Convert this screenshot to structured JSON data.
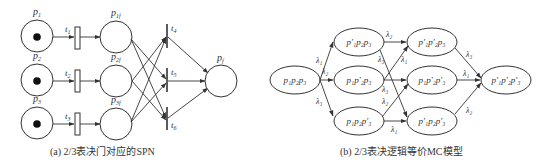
{
  "panel_a": {
    "caption": "(a) 2/3表决门对应的SPN",
    "places": [
      {
        "id": "p1",
        "label": "p",
        "sub": "1",
        "cx": 37,
        "cy": 36,
        "token": true
      },
      {
        "id": "p2",
        "label": "p",
        "sub": "2",
        "cx": 37,
        "cy": 80,
        "token": true
      },
      {
        "id": "p3",
        "label": "p",
        "sub": "3",
        "cx": 37,
        "cy": 123,
        "token": true
      },
      {
        "id": "p1f",
        "label": "p",
        "sub": "1f",
        "cx": 116,
        "cy": 36,
        "token": false
      },
      {
        "id": "p2f",
        "label": "p",
        "sub": "2f",
        "cx": 116,
        "cy": 80,
        "token": false
      },
      {
        "id": "p3f",
        "label": "p",
        "sub": "3f",
        "cx": 116,
        "cy": 123,
        "token": false
      },
      {
        "id": "pf",
        "label": "p",
        "sub": "f",
        "cx": 222,
        "cy": 80,
        "token": false
      }
    ],
    "timed_transitions": [
      {
        "id": "t1",
        "label": "t",
        "sub": "1"
      },
      {
        "id": "t2",
        "label": "t",
        "sub": "2"
      },
      {
        "id": "t3",
        "label": "t",
        "sub": "3"
      }
    ],
    "immediate_transitions": [
      {
        "id": "t4",
        "label": "t",
        "sub": "4"
      },
      {
        "id": "t5",
        "label": "t",
        "sub": "5"
      },
      {
        "id": "t6",
        "label": "t",
        "sub": "6"
      }
    ]
  },
  "panel_b": {
    "caption": "(b) 2/3表决逻辑等价MC模型",
    "states": [
      {
        "id": "s0",
        "text": "p₁p₂p₃"
      },
      {
        "id": "s1",
        "text": "p′₁p₂p₃"
      },
      {
        "id": "s2",
        "text": "p₁p′₂p₃"
      },
      {
        "id": "s3",
        "text": "p₁p₂p′₃"
      },
      {
        "id": "s4",
        "text": "p′₁p′₂p₃"
      },
      {
        "id": "s5",
        "text": "p₁p′₂p′₃"
      },
      {
        "id": "s6",
        "text": "p′₁p₂p′₃"
      },
      {
        "id": "s7",
        "text": "p′₁p′₂p′₃"
      }
    ],
    "rates": {
      "l1": "λ₁",
      "l2": "λ₂",
      "l3": "λ₃"
    }
  }
}
